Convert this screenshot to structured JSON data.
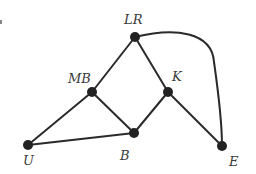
{
  "diagram": {
    "type": "undirected-graph",
    "vertices": [
      {
        "id": "LR",
        "label": "LR",
        "x": 135,
        "y": 37,
        "label_x": 124,
        "label_y": 24
      },
      {
        "id": "MB",
        "label": "MB",
        "x": 92,
        "y": 92,
        "label_x": 68,
        "label_y": 83
      },
      {
        "id": "K",
        "label": "K",
        "x": 168,
        "y": 92,
        "label_x": 172,
        "label_y": 81
      },
      {
        "id": "B",
        "label": "B",
        "x": 134,
        "y": 133,
        "label_x": 120,
        "label_y": 160
      },
      {
        "id": "U",
        "label": "U",
        "x": 28,
        "y": 145,
        "label_x": 23,
        "label_y": 165
      },
      {
        "id": "E",
        "label": "E",
        "x": 222,
        "y": 146,
        "label_x": 229,
        "label_y": 166
      }
    ],
    "edges": [
      {
        "from": "LR",
        "to": "MB",
        "shape": "line"
      },
      {
        "from": "LR",
        "to": "K",
        "shape": "line"
      },
      {
        "from": "LR",
        "to": "E",
        "shape": "curve"
      },
      {
        "from": "MB",
        "to": "U",
        "shape": "line"
      },
      {
        "from": "MB",
        "to": "B",
        "shape": "line"
      },
      {
        "from": "K",
        "to": "B",
        "shape": "line"
      },
      {
        "from": "K",
        "to": "E",
        "shape": "line"
      },
      {
        "from": "U",
        "to": "B",
        "shape": "line"
      }
    ],
    "colors": {
      "edge": "#2a2a2a",
      "vertex": "#222222",
      "label": "#3a3a3a",
      "background": "#ffffff"
    }
  }
}
